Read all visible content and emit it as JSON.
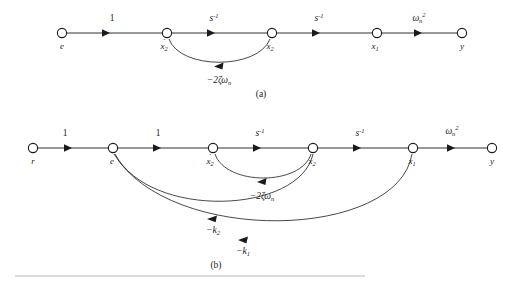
{
  "figure": {
    "background": "#ffffff",
    "ink_color": "#1a1a1a",
    "rule_color": "#b8b8b8"
  },
  "diagram_a": {
    "caption": "(a)",
    "nodes": [
      {
        "id": "e",
        "label": "e",
        "dot": false,
        "sub": "",
        "x": 62,
        "y": 33
      },
      {
        "id": "xd2",
        "label": "x",
        "dot": true,
        "sub": "2",
        "x": 167,
        "y": 33
      },
      {
        "id": "x2",
        "label": "x",
        "dot": false,
        "sub": "2",
        "x": 272,
        "y": 33
      },
      {
        "id": "x1",
        "label": "x",
        "dot": false,
        "sub": "1",
        "x": 377,
        "y": 33
      },
      {
        "id": "y",
        "label": "y",
        "dot": false,
        "sub": "",
        "x": 462,
        "y": 33
      }
    ],
    "edges": [
      {
        "from": "e",
        "to": "xd2",
        "gain_base": "1",
        "gain_sup": "",
        "gain_sub": "",
        "italic": false
      },
      {
        "from": "xd2",
        "to": "x2",
        "gain_base": "s",
        "gain_sup": "-1",
        "gain_sub": "",
        "italic": true
      },
      {
        "from": "x2",
        "to": "x1",
        "gain_base": "s",
        "gain_sup": "-1",
        "gain_sub": "",
        "italic": true
      },
      {
        "from": "x1",
        "to": "y",
        "gain_base": "ω",
        "gain_sup": "2",
        "gain_sub": "n",
        "italic": true
      }
    ],
    "feedback": [
      {
        "id": "damping",
        "from": "x2",
        "to": "xd2",
        "label_prefix": "−2ζω",
        "label_sub": "n",
        "label_x": 219,
        "label_y": 80
      }
    ]
  },
  "diagram_b": {
    "caption": "(b)",
    "nodes": [
      {
        "id": "r",
        "label": "r",
        "dot": false,
        "sub": "",
        "x": 33,
        "y": 148
      },
      {
        "id": "e",
        "label": "e",
        "dot": false,
        "sub": "",
        "x": 113,
        "y": 148
      },
      {
        "id": "xd2",
        "label": "x",
        "dot": true,
        "sub": "2",
        "x": 213,
        "y": 148
      },
      {
        "id": "x2",
        "label": "x",
        "dot": false,
        "sub": "2",
        "x": 313,
        "y": 148
      },
      {
        "id": "x1",
        "label": "x",
        "dot": false,
        "sub": "1",
        "x": 413,
        "y": 148
      },
      {
        "id": "y",
        "label": "y",
        "dot": false,
        "sub": "",
        "x": 492,
        "y": 148
      }
    ],
    "edges": [
      {
        "from": "r",
        "to": "e",
        "gain_base": "1",
        "gain_sup": "",
        "gain_sub": "",
        "italic": false
      },
      {
        "from": "e",
        "to": "xd2",
        "gain_base": "1",
        "gain_sup": "",
        "gain_sub": "",
        "italic": false
      },
      {
        "from": "xd2",
        "to": "x2",
        "gain_base": "s",
        "gain_sup": "-1",
        "gain_sub": "",
        "italic": true
      },
      {
        "from": "x2",
        "to": "x1",
        "gain_base": "s",
        "gain_sup": "-1",
        "gain_sub": "",
        "italic": true
      },
      {
        "from": "x1",
        "to": "y",
        "gain_base": "ω",
        "gain_sup": "2",
        "gain_sub": "n",
        "italic": true
      }
    ],
    "feedback": [
      {
        "id": "damping",
        "from": "x2",
        "to": "xd2",
        "label_prefix": "−2ζω",
        "label_sub": "n",
        "label_x": 262,
        "label_y": 196
      },
      {
        "id": "gain-k2",
        "from": "x2",
        "to": "e",
        "label_prefix": "−k",
        "label_sub": "2",
        "label_x": 213,
        "label_y": 230
      },
      {
        "id": "gain-k1",
        "from": "x1",
        "to": "e",
        "label_prefix": "−k",
        "label_sub": "1",
        "label_x": 243,
        "label_y": 251
      }
    ]
  },
  "separator": {
    "x1": 15,
    "x2": 365,
    "y": 276
  }
}
